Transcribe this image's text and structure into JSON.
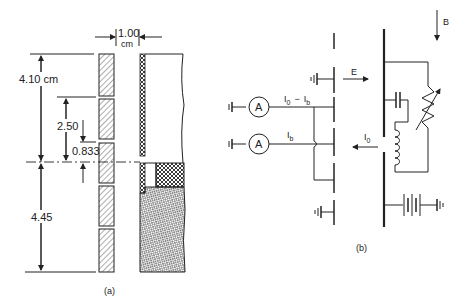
{
  "figure": {
    "panel_a": {
      "caption": "(a)",
      "dimensions": {
        "gap_width_value": "1.00",
        "gap_width_unit": "cm",
        "top_height": "4.10 cm",
        "slot_pitch": "2.50",
        "slot_offset": "0.833",
        "bottom_height": "4.45"
      }
    },
    "panel_b": {
      "caption": "(b)",
      "field_E": "E",
      "field_B": "B",
      "current_upper": "I",
      "current_upper_sub0": "0",
      "current_upper_minus": "−",
      "current_upper_sub_b": "b",
      "current_lower": "I",
      "current_lower_sub": "b",
      "current_return": "I",
      "current_return_sub": "0",
      "ammeter_label": "A"
    }
  }
}
